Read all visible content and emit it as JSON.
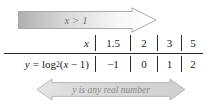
{
  "figure": {
    "domain_banner": {
      "text": "x > 1",
      "arrow_direction": "right",
      "fill_start": "#b4b4b4",
      "fill_end": "#ffffff",
      "stroke": "#9a9a9a",
      "text_color": "#6e6e6e"
    },
    "range_banner": {
      "text": "y is any real number",
      "arrow_direction": "both",
      "fill": "#d8d8d8",
      "stroke": "#b0b0b0",
      "text_color": "#8c8c8c"
    },
    "table": {
      "row_labels": [
        "x",
        "y = log2(x − 1)"
      ],
      "row_label_top": "x",
      "row_label_bottom_lhs": "y",
      "row_label_bottom_eq": "=",
      "row_label_bottom_func": "log",
      "row_label_bottom_base": "2",
      "row_label_bottom_arg_open": "(",
      "row_label_bottom_arg_var": "x",
      "row_label_bottom_arg_op": "−",
      "row_label_bottom_arg_num": "1",
      "row_label_bottom_arg_close": ")",
      "columns": [
        {
          "x": "1.5",
          "y": "−1"
        },
        {
          "x": "2",
          "y": "0"
        },
        {
          "x": "3",
          "y": "1"
        },
        {
          "x": "5",
          "y": "2"
        }
      ],
      "rule_color": "#2b2b2b"
    }
  }
}
